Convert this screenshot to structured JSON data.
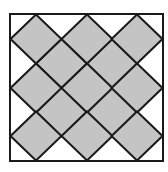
{
  "diagram": {
    "title": "",
    "frame": {
      "x": 10,
      "y": 14,
      "width": 153,
      "height": 147
    },
    "colors": {
      "fill": "#c4c4c4",
      "stroke": "#1a1a1a",
      "background": "#ffffff"
    },
    "diamond_half_diagonal_x": 25.5,
    "diamond_half_diagonal_y": 24.5,
    "outer_diamond_centers": [
      [
        36,
        39
      ],
      [
        87,
        39
      ],
      [
        137,
        39
      ],
      [
        36,
        88
      ],
      [
        87,
        88
      ],
      [
        137,
        88
      ],
      [
        36,
        136
      ],
      [
        87,
        136
      ],
      [
        137,
        136
      ]
    ],
    "inner_diamond_centers": [
      [
        61.5,
        63.5
      ],
      [
        112,
        63.5
      ],
      [
        61.5,
        112
      ],
      [
        112,
        112
      ]
    ]
  }
}
